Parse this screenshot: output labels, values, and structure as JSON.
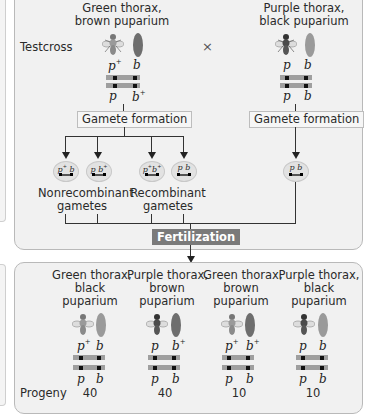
{
  "parents": {
    "testcross_label": "Testcross",
    "cross_symbol": "×",
    "left": {
      "phenotype_line1": "Green thorax,",
      "phenotype_line2": "brown puparium",
      "top_allele_1": "p",
      "top_allele_1_sup": "+",
      "top_allele_2": "b",
      "top_allele_2_sup": "",
      "bottom_allele_1": "p",
      "bottom_allele_1_sup": "",
      "bottom_allele_2": "b",
      "bottom_allele_2_sup": "+",
      "thorax_color": "#9a9a9a",
      "puparium_color": "#6e6e6e"
    },
    "right": {
      "phenotype_line1": "Purple thorax,",
      "phenotype_line2": "black puparium",
      "top_allele_1": "p",
      "top_allele_2": "b",
      "bottom_allele_1": "p",
      "bottom_allele_2": "b",
      "thorax_color": "#4a4a4a",
      "puparium_color": "#9a9a9a"
    }
  },
  "gamete_formation_label": "Gamete formation",
  "gametes": [
    {
      "a1": "p",
      "a1_sup": "+",
      "a2": "b",
      "a2_sup": ""
    },
    {
      "a1": "p",
      "a1_sup": "",
      "a2": "b",
      "a2_sup": "+"
    },
    {
      "a1": "p",
      "a1_sup": "+",
      "a2": "b",
      "a2_sup": "+"
    },
    {
      "a1": "p",
      "a1_sup": "",
      "a2": "b",
      "a2_sup": ""
    },
    {
      "a1": "p",
      "a1_sup": "",
      "a2": "b",
      "a2_sup": ""
    }
  ],
  "nonrecombinant_label_1": "Nonrecombinant",
  "nonrecombinant_label_2": "gametes",
  "recombinant_label_1": "Recombinant",
  "recombinant_label_2": "gametes",
  "fertilization_label": "Fertilization",
  "progeny_label": "Progeny",
  "progeny": [
    {
      "line1": "Green thorax,",
      "line2": "black",
      "line3": "puparium",
      "top1": "p",
      "top1_sup": "+",
      "top2": "b",
      "top2_sup": "",
      "bot1": "p",
      "bot2": "b",
      "count": "40"
    },
    {
      "line1": "Purple thorax,",
      "line2": "brown",
      "line3": "puparium",
      "top1": "p",
      "top1_sup": "",
      "top2": "b",
      "top2_sup": "+",
      "bot1": "p",
      "bot2": "b",
      "count": "40"
    },
    {
      "line1": "Green thorax,",
      "line2": "brown",
      "line3": "puparium",
      "top1": "p",
      "top1_sup": "+",
      "top2": "b",
      "top2_sup": "+",
      "bot1": "p",
      "bot2": "b",
      "count": "10"
    },
    {
      "line1": "Purple thorax,",
      "line2": "black",
      "line3": "puparium",
      "top1": "p",
      "top1_sup": "",
      "top2": "b",
      "top2_sup": "",
      "bot1": "p",
      "bot2": "b",
      "count": "10"
    }
  ],
  "colors": {
    "panel_bg": "#f1f1f1",
    "panel_border": "#b9b9b9",
    "chromosome": "#9f9f9f",
    "fertilization_bg": "#7a7a7a"
  }
}
